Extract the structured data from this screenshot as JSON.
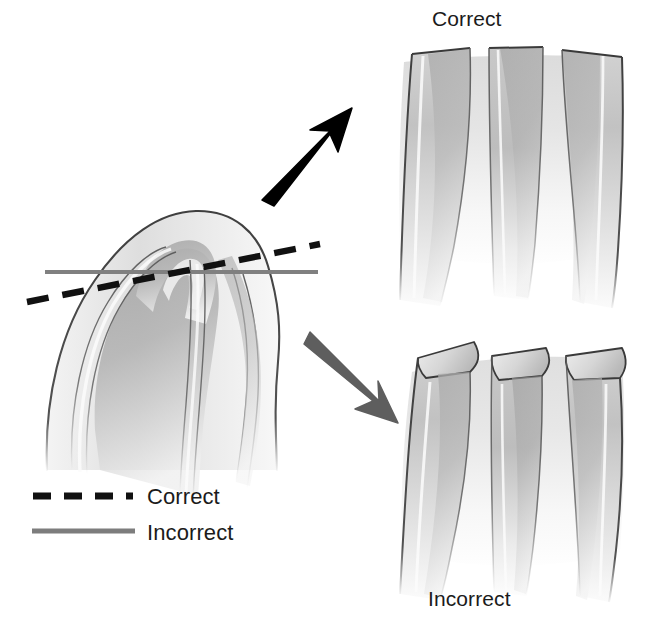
{
  "figure": {
    "kind": "anatomical-sectioning-diagram",
    "background_color": "#ffffff",
    "width": 645,
    "height": 619
  },
  "panels": {
    "source": {
      "name": "longitudinal-specimen",
      "description": "Sagittal view of curved fiber bundle with dome-shaped apex"
    },
    "correct": {
      "label": "Correct",
      "label_position": "top",
      "cut_type": "perpendicular-to-fibers"
    },
    "incorrect": {
      "label": "Incorrect",
      "label_position": "bottom",
      "cut_type": "oblique-to-fibers"
    }
  },
  "arrows": [
    {
      "name": "arrow-to-correct",
      "color": "#000000",
      "direction": "up-right",
      "target": "Correct"
    },
    {
      "name": "arrow-to-incorrect",
      "color": "#5e5e5e",
      "direction": "down-right",
      "target": "Incorrect"
    }
  ],
  "cut_lines": [
    {
      "name": "correct-plane",
      "label": "Correct",
      "style": "dashed",
      "color": "#111111",
      "orientation": "oblique-rising"
    },
    {
      "name": "incorrect-plane",
      "label": "Incorrect",
      "style": "solid",
      "color": "#808080",
      "orientation": "horizontal"
    }
  ],
  "legend": {
    "items": [
      {
        "label": "Correct",
        "style": "dashed",
        "color": "#111111"
      },
      {
        "label": "Incorrect",
        "style": "solid",
        "color": "#7d7d7d"
      }
    ]
  },
  "colors": {
    "outline": "#4a4a4a",
    "outline_dark": "#3a3a3a",
    "fiber_mid": "#b4b4b4",
    "fiber_light": "#e8e8e8",
    "fiber_dark": "#9a9a9a",
    "highlight": "#fbfbfb",
    "black": "#000000",
    "gray_arrow": "#5e5e5e",
    "text": "#1b1b1b"
  }
}
